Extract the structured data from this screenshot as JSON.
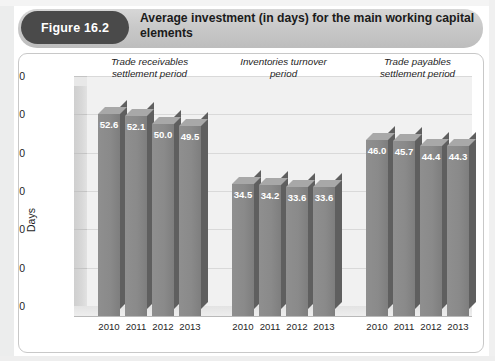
{
  "header": {
    "figure_label": "Figure 16.2",
    "title": "Average investment (in days) for the main working capital elements",
    "pill_color": "#4a4a4a",
    "band_color": "#c9c9c9"
  },
  "chart_data": {
    "type": "bar",
    "title": "Average investment (in days) for the main working capital elements",
    "xlabel": "",
    "ylabel": "Days",
    "ylim": [
      0,
      60
    ],
    "yticks": [
      0,
      10,
      20,
      30,
      40,
      50,
      60
    ],
    "grid": true,
    "legend": "none",
    "bar_color": "#8a8a8a",
    "categories": [
      "2010",
      "2011",
      "2012",
      "2013"
    ],
    "groups": [
      {
        "name": "Trade receivables settlement period",
        "name_line1": "Trade receivables",
        "name_line2": "settlement period",
        "categories": [
          "2010",
          "2011",
          "2012",
          "2013"
        ],
        "values": [
          52.6,
          52.1,
          50.0,
          49.5
        ],
        "labels": [
          "52.6",
          "52.1",
          "50.0",
          "49.5"
        ]
      },
      {
        "name": "Inventories turnover period",
        "name_line1": "Inventories turnover",
        "name_line2": "period",
        "categories": [
          "2010",
          "2011",
          "2012",
          "2013"
        ],
        "values": [
          34.5,
          34.2,
          33.6,
          33.6
        ],
        "labels": [
          "34.5",
          "34.2",
          "33.6",
          "33.6"
        ]
      },
      {
        "name": "Trade payables settlement period",
        "name_line1": "Trade payables",
        "name_line2": "settlement period",
        "categories": [
          "2010",
          "2011",
          "2012",
          "2013"
        ],
        "values": [
          46.0,
          45.7,
          44.4,
          44.3
        ],
        "labels": [
          "46.0",
          "45.7",
          "44.4",
          "44.3"
        ]
      }
    ]
  },
  "axis": {
    "y_label": "Days",
    "y_ticks": [
      "60",
      "50",
      "40",
      "30",
      "20",
      "10",
      "0"
    ]
  }
}
